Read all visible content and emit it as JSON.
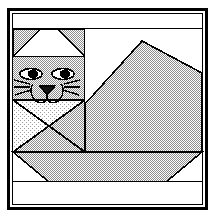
{
  "image": {
    "title": "Cat Quilt Block Pattern",
    "subject": "cat",
    "style": "pieced patchwork quilt block line drawing",
    "width": 215,
    "height": 218
  },
  "colors": {
    "background": "#ffffff",
    "line": "#000000",
    "fabric_print": "#c8c8c8",
    "fabric_light": "#e2e2e2",
    "fabric_white": "#ffffff",
    "eye_pupil": "#000000",
    "nose": "#1a1a1a"
  },
  "frame": {
    "label": "block-outer-border",
    "outer": {
      "x": 7,
      "y": 8,
      "width": 200,
      "height": 202
    },
    "inner": {
      "x": 11,
      "y": 12,
      "width": 192,
      "height": 194
    },
    "border_width": 3
  },
  "patches": {
    "top_sashing": {
      "label": "top background strip",
      "fill": "fabric_white"
    },
    "left_ear": {
      "label": "left ear triangle",
      "fill": "fabric_print"
    },
    "right_ear": {
      "label": "right ear triangle",
      "fill": "fabric_print"
    },
    "ear_gap": {
      "label": "between-ears background triangle",
      "fill": "fabric_white"
    },
    "head": {
      "label": "cat head square",
      "fill": "fabric_print"
    },
    "chest_left": {
      "label": "left chest triangle",
      "fill": "fabric_print"
    },
    "chest_light": {
      "label": "light chest triangle",
      "fill": "fabric_light"
    },
    "body": {
      "label": "cat body / back",
      "fill": "fabric_print"
    },
    "back_sky": {
      "label": "background above back",
      "fill": "fabric_white"
    },
    "bottom_band": {
      "label": "bottom background strip",
      "fill": "fabric_white"
    },
    "bottom_corners": {
      "label": "bottom corner background triangles",
      "fill": "fabric_white"
    }
  },
  "face": {
    "left_eye": {
      "label": "left eye",
      "cx": 31,
      "cy": 74,
      "rx": 11,
      "ry": 6
    },
    "right_eye": {
      "label": "right eye",
      "cx": 62,
      "cy": 74,
      "rx": 11,
      "ry": 6
    },
    "nose": {
      "label": "nose triangle",
      "cx": 47,
      "cy": 90
    },
    "mouth": {
      "label": "mouth curves"
    },
    "whiskers_left": {
      "label": "left whiskers",
      "count": 3
    },
    "whiskers_right": {
      "label": "right whiskers",
      "count": 3
    }
  },
  "geometry": {
    "head_block": {
      "x": 11,
      "y": 29,
      "width": 74,
      "height": 123
    },
    "ear_row": {
      "y_top": 29,
      "y_bottom": 57
    },
    "chest_row": {
      "y_top": 100,
      "y_bottom": 152
    },
    "body_block": {
      "x": 85,
      "y": 29,
      "width": 118,
      "height": 123
    },
    "back_diagonal": {
      "x1": 85,
      "y1": 104,
      "x2": 203,
      "y2": 41
    },
    "back_right_diagonal": {
      "x1": 142,
      "y1": 41,
      "x2": 203,
      "y2": 73
    },
    "bottom_row": {
      "y_top": 152,
      "y_bottom": 182
    },
    "bottom_strip": {
      "y_top": 182,
      "y_bottom": 206
    },
    "head_divider_x": 85
  }
}
